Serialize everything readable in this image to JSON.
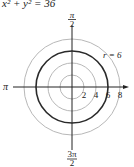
{
  "equation": "x² + y² = 36",
  "labels": {
    "top": {
      "num": "π",
      "den": "2"
    },
    "bottom": {
      "num": "3π",
      "den": "2"
    },
    "left": "π",
    "circle": "r = 6",
    "ticks": [
      "2",
      "4",
      "6",
      "8"
    ]
  },
  "plot": {
    "center": [
      72,
      87
    ],
    "unit_px": 6,
    "grid_radii": [
      2,
      4,
      8
    ],
    "highlight_radius": 6,
    "colors": {
      "grid": "#b8b8b8",
      "highlight": "#2a2a2a",
      "axis": "#222222"
    }
  }
}
